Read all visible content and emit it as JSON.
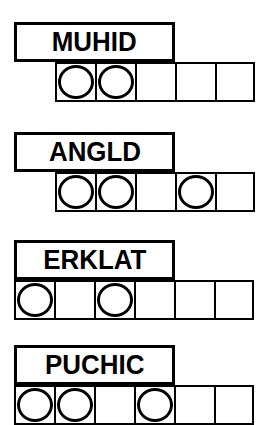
{
  "sheet": {
    "background_color": "#ffffff",
    "ink_color": "#000000",
    "description": "Worksheet with four word-label boxes, each above a strip of empty square cells; some cells contain drawn circles."
  },
  "geometry": {
    "cell_size": 40,
    "label_box_height": 40,
    "label_box_width": 161,
    "label_box_left": 14
  },
  "rows": [
    {
      "word": "MUHID",
      "label_left": 14,
      "label_top": 22,
      "label_width": 161,
      "label_height": 40,
      "grid_left": 55,
      "grid_top": 62,
      "cell_count": 5,
      "circles": [
        true,
        true,
        false,
        false,
        false
      ]
    },
    {
      "word": "ANGLD",
      "label_left": 14,
      "label_top": 132,
      "label_width": 161,
      "label_height": 40,
      "grid_left": 55,
      "grid_top": 172,
      "cell_count": 5,
      "circles": [
        true,
        true,
        false,
        true,
        false
      ]
    },
    {
      "word": "ERKLAT",
      "label_left": 14,
      "label_top": 240,
      "label_width": 161,
      "label_height": 40,
      "grid_left": 14,
      "grid_top": 280,
      "cell_count": 6,
      "circles": [
        true,
        false,
        true,
        false,
        false,
        false
      ]
    },
    {
      "word": "PUCHIC",
      "label_left": 14,
      "label_top": 345,
      "label_width": 161,
      "label_height": 40,
      "grid_left": 14,
      "grid_top": 385,
      "cell_count": 6,
      "circles": [
        true,
        true,
        false,
        true,
        false,
        false
      ]
    }
  ]
}
